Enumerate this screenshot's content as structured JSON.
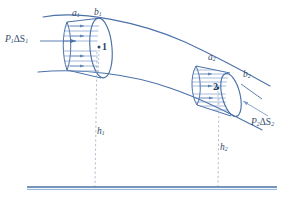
{
  "figure": {
    "colors": {
      "stroke": "#4a71a8",
      "stroke_light": "#7c9cc6",
      "baseline": "#4a71a8",
      "dashed": "#9aafc7",
      "label": "#2f4a6d"
    }
  },
  "labels": {
    "a1": "a",
    "a1_sub": "1",
    "b1": "b",
    "b1_sub": "1",
    "a2": "a",
    "a2_sub": "2",
    "b2": "b",
    "b2_sub": "2",
    "h1": "h",
    "h1_sub": "1",
    "h2": "h",
    "h2_sub": "2",
    "p1": "P",
    "p1_sub": "1",
    "p1_delta": "ΔS",
    "p1_delta_sub": "1",
    "p2": "P",
    "p2_sub": "2",
    "p2_delta": "ΔS",
    "p2_delta_sub": "2",
    "point1": "1",
    "point2": "2"
  },
  "elements": {
    "pipe_upper_wall": "upper pipe boundary curve",
    "pipe_lower_wall": "lower pipe boundary curve",
    "cylinder1": "fluid element 1 at section a1-b1",
    "cylinder2": "fluid element 2 at section a2-b2",
    "baseline": "reference datum line",
    "height_line_1": "dashed height line h1",
    "height_line_2": "dashed height line h2",
    "force_arrow_1": "pressure force arrow P1 dS1",
    "force_arrow_2": "pressure force arrow P2 dS2"
  }
}
